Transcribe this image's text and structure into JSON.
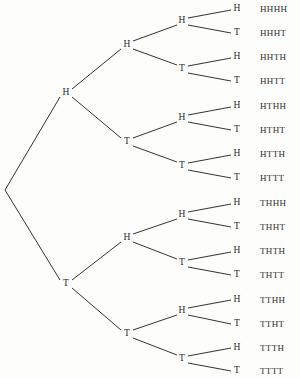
{
  "diagram": {
    "type": "binary-tree",
    "depth": 4,
    "line_color": "#333333",
    "text_color": "#2b2b2b",
    "background_color": "#fdfdfc",
    "root": {
      "label": "",
      "x": 5,
      "y": 190
    },
    "level1": [
      {
        "id": "n-H",
        "label": "H",
        "x": 66,
        "y": 93
      },
      {
        "id": "n-T",
        "label": "T",
        "x": 66,
        "y": 284
      }
    ],
    "level2": [
      {
        "id": "n-HH",
        "label": "H",
        "x": 127,
        "y": 45
      },
      {
        "id": "n-HT",
        "label": "T",
        "x": 127,
        "y": 142
      },
      {
        "id": "n-TH",
        "label": "H",
        "x": 127,
        "y": 238
      },
      {
        "id": "n-TT",
        "label": "T",
        "x": 127,
        "y": 334
      }
    ],
    "level3": [
      {
        "id": "n-HHH",
        "label": "H",
        "x": 182,
        "y": 21
      },
      {
        "id": "n-HHT",
        "label": "T",
        "x": 182,
        "y": 69
      },
      {
        "id": "n-HTH",
        "label": "H",
        "x": 182,
        "y": 118
      },
      {
        "id": "n-HTT",
        "label": "T",
        "x": 182,
        "y": 166
      },
      {
        "id": "n-THH",
        "label": "H",
        "x": 182,
        "y": 215
      },
      {
        "id": "n-THT",
        "label": "T",
        "x": 182,
        "y": 263
      },
      {
        "id": "n-TTH",
        "label": "H",
        "x": 182,
        "y": 311
      },
      {
        "id": "n-TTT",
        "label": "T",
        "x": 182,
        "y": 359
      }
    ],
    "leaves": [
      {
        "id": "leaf-0",
        "label": "H",
        "outcome": "HHHH",
        "x": 237,
        "y": 9
      },
      {
        "id": "leaf-1",
        "label": "T",
        "outcome": "HHHT",
        "x": 237,
        "y": 33
      },
      {
        "id": "leaf-2",
        "label": "H",
        "outcome": "HHTH",
        "x": 237,
        "y": 57
      },
      {
        "id": "leaf-3",
        "label": "T",
        "outcome": "HHTT",
        "x": 237,
        "y": 81
      },
      {
        "id": "leaf-4",
        "label": "H",
        "outcome": "HTHH",
        "x": 237,
        "y": 106
      },
      {
        "id": "leaf-5",
        "label": "T",
        "outcome": "HTHT",
        "x": 237,
        "y": 130
      },
      {
        "id": "leaf-6",
        "label": "H",
        "outcome": "HTTH",
        "x": 237,
        "y": 154
      },
      {
        "id": "leaf-7",
        "label": "T",
        "outcome": "HTTT",
        "x": 237,
        "y": 178
      },
      {
        "id": "leaf-8",
        "label": "H",
        "outcome": "THHH",
        "x": 237,
        "y": 203
      },
      {
        "id": "leaf-9",
        "label": "T",
        "outcome": "THHT",
        "x": 237,
        "y": 227
      },
      {
        "id": "leaf-10",
        "label": "H",
        "outcome": "THTH",
        "x": 237,
        "y": 251
      },
      {
        "id": "leaf-11",
        "label": "T",
        "outcome": "THTT",
        "x": 237,
        "y": 275
      },
      {
        "id": "leaf-12",
        "label": "H",
        "outcome": "TTHH",
        "x": 237,
        "y": 300
      },
      {
        "id": "leaf-13",
        "label": "T",
        "outcome": "TTHT",
        "x": 237,
        "y": 324
      },
      {
        "id": "leaf-14",
        "label": "H",
        "outcome": "TTTH",
        "x": 237,
        "y": 348
      },
      {
        "id": "leaf-15",
        "label": "T",
        "outcome": "TTTT",
        "x": 237,
        "y": 371
      }
    ],
    "outcome_column_x": 260,
    "edges": [
      {
        "name": "edge-root-H",
        "x1": 5,
        "y1": 190,
        "x2": 60,
        "y2": 97
      },
      {
        "name": "edge-root-T",
        "x1": 5,
        "y1": 190,
        "x2": 60,
        "y2": 280
      },
      {
        "name": "edge-H-HH",
        "x1": 72,
        "y1": 89,
        "x2": 121,
        "y2": 49
      },
      {
        "name": "edge-H-HT",
        "x1": 72,
        "y1": 97,
        "x2": 121,
        "y2": 138
      },
      {
        "name": "edge-T-TH",
        "x1": 72,
        "y1": 280,
        "x2": 121,
        "y2": 242
      },
      {
        "name": "edge-T-TT",
        "x1": 72,
        "y1": 288,
        "x2": 121,
        "y2": 330
      },
      {
        "name": "edge-HH-HHH",
        "x1": 133,
        "y1": 41,
        "x2": 177,
        "y2": 25
      },
      {
        "name": "edge-HH-HHT",
        "x1": 133,
        "y1": 49,
        "x2": 177,
        "y2": 65
      },
      {
        "name": "edge-HT-HTH",
        "x1": 133,
        "y1": 138,
        "x2": 177,
        "y2": 122
      },
      {
        "name": "edge-HT-HTT",
        "x1": 133,
        "y1": 146,
        "x2": 177,
        "y2": 162
      },
      {
        "name": "edge-TH-THH",
        "x1": 133,
        "y1": 234,
        "x2": 177,
        "y2": 219
      },
      {
        "name": "edge-TH-THT",
        "x1": 133,
        "y1": 242,
        "x2": 177,
        "y2": 259
      },
      {
        "name": "edge-TT-TTH",
        "x1": 133,
        "y1": 330,
        "x2": 177,
        "y2": 315
      },
      {
        "name": "edge-TT-TTT",
        "x1": 133,
        "y1": 338,
        "x2": 177,
        "y2": 355
      },
      {
        "name": "edge-HHH-leaf0",
        "x1": 188,
        "y1": 18,
        "x2": 231,
        "y2": 10
      },
      {
        "name": "edge-HHH-leaf1",
        "x1": 188,
        "y1": 25,
        "x2": 231,
        "y2": 33
      },
      {
        "name": "edge-HHT-leaf2",
        "x1": 188,
        "y1": 66,
        "x2": 231,
        "y2": 58
      },
      {
        "name": "edge-HHT-leaf3",
        "x1": 188,
        "y1": 73,
        "x2": 231,
        "y2": 81
      },
      {
        "name": "edge-HTH-leaf4",
        "x1": 188,
        "y1": 115,
        "x2": 231,
        "y2": 107
      },
      {
        "name": "edge-HTH-leaf5",
        "x1": 188,
        "y1": 122,
        "x2": 231,
        "y2": 130
      },
      {
        "name": "edge-HTT-leaf6",
        "x1": 188,
        "y1": 163,
        "x2": 231,
        "y2": 155
      },
      {
        "name": "edge-HTT-leaf7",
        "x1": 188,
        "y1": 170,
        "x2": 231,
        "y2": 178
      },
      {
        "name": "edge-THH-leaf8",
        "x1": 188,
        "y1": 212,
        "x2": 231,
        "y2": 204
      },
      {
        "name": "edge-THH-leaf9",
        "x1": 188,
        "y1": 219,
        "x2": 231,
        "y2": 227
      },
      {
        "name": "edge-THT-leaf10",
        "x1": 188,
        "y1": 260,
        "x2": 231,
        "y2": 252
      },
      {
        "name": "edge-THT-leaf11",
        "x1": 188,
        "y1": 267,
        "x2": 231,
        "y2": 275
      },
      {
        "name": "edge-TTH-leaf12",
        "x1": 188,
        "y1": 308,
        "x2": 231,
        "y2": 300
      },
      {
        "name": "edge-TTH-leaf13",
        "x1": 188,
        "y1": 315,
        "x2": 231,
        "y2": 324
      },
      {
        "name": "edge-TTT-leaf14",
        "x1": 188,
        "y1": 356,
        "x2": 231,
        "y2": 348
      },
      {
        "name": "edge-TTT-leaf15",
        "x1": 188,
        "y1": 363,
        "x2": 231,
        "y2": 371
      }
    ]
  }
}
